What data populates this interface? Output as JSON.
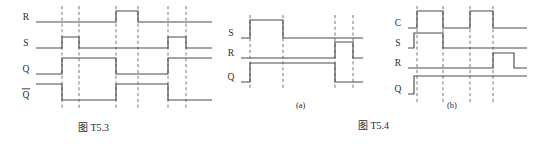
{
  "page": {
    "background": "#ffffff",
    "ink": "#4a4a4a",
    "text_color": "#2b2b2b",
    "width": 540,
    "height": 144
  },
  "figures": [
    {
      "id": "fig-t53",
      "caption": "图 T5.3",
      "sub_caption": "",
      "type": "digital-timing-diagram",
      "description": "SR latch timing diagram with R, S, Q and Q-bar waveforms",
      "grid_lines_x": [
        62,
        79,
        116,
        138,
        168,
        186
      ],
      "signals": [
        {
          "name": "R",
          "label": "R",
          "overbar": false,
          "baseline_y": 22,
          "high_y": 11,
          "segments": [
            {
              "x_start": 36,
              "x_end": 116,
              "level": "low"
            },
            {
              "x_start": 116,
              "x_end": 138,
              "level": "high"
            },
            {
              "x_start": 138,
              "x_end": 212,
              "level": "low"
            }
          ]
        },
        {
          "name": "S",
          "label": "S",
          "overbar": false,
          "baseline_y": 48,
          "high_y": 37,
          "segments": [
            {
              "x_start": 36,
              "x_end": 62,
              "level": "low"
            },
            {
              "x_start": 62,
              "x_end": 79,
              "level": "high"
            },
            {
              "x_start": 79,
              "x_end": 168,
              "level": "low"
            },
            {
              "x_start": 168,
              "x_end": 186,
              "level": "high"
            },
            {
              "x_start": 186,
              "x_end": 212,
              "level": "low"
            }
          ]
        },
        {
          "name": "Q",
          "label": "Q",
          "overbar": false,
          "baseline_y": 74,
          "high_y": 58,
          "segments": [
            {
              "x_start": 36,
              "x_end": 62,
              "level": "low"
            },
            {
              "x_start": 62,
              "x_end": 116,
              "level": "high"
            },
            {
              "x_start": 116,
              "x_end": 168,
              "level": "low"
            },
            {
              "x_start": 168,
              "x_end": 212,
              "level": "high"
            }
          ]
        },
        {
          "name": "Qbar",
          "label": "Q",
          "overbar": true,
          "baseline_y": 100,
          "high_y": 84,
          "segments": [
            {
              "x_start": 36,
              "x_end": 62,
              "level": "high"
            },
            {
              "x_start": 62,
              "x_end": 116,
              "level": "low"
            },
            {
              "x_start": 116,
              "x_end": 168,
              "level": "high"
            },
            {
              "x_start": 168,
              "x_end": 212,
              "level": "low"
            }
          ]
        }
      ]
    },
    {
      "id": "fig-t54a",
      "caption": "",
      "sub_caption": "(a)",
      "type": "digital-timing-diagram",
      "description": "Timing diagram (a) with S, R and Q waveforms",
      "grid_lines_x": [
        250,
        283,
        335,
        353
      ],
      "signals": [
        {
          "name": "S",
          "label": "S",
          "overbar": false,
          "baseline_y": 38,
          "high_y": 20,
          "segments": [
            {
              "x_start": 241,
              "x_end": 250,
              "level": "low"
            },
            {
              "x_start": 250,
              "x_end": 283,
              "level": "high"
            },
            {
              "x_start": 283,
              "x_end": 363,
              "level": "low"
            }
          ]
        },
        {
          "name": "R",
          "label": "R",
          "overbar": false,
          "baseline_y": 58,
          "high_y": 42,
          "segments": [
            {
              "x_start": 241,
              "x_end": 335,
              "level": "low"
            },
            {
              "x_start": 335,
              "x_end": 353,
              "level": "high"
            },
            {
              "x_start": 353,
              "x_end": 363,
              "level": "low"
            }
          ]
        },
        {
          "name": "Q",
          "label": "Q",
          "overbar": false,
          "baseline_y": 82,
          "high_y": 63,
          "segments": [
            {
              "x_start": 241,
              "x_end": 250,
              "level": "low"
            },
            {
              "x_start": 250,
              "x_end": 335,
              "level": "high"
            },
            {
              "x_start": 335,
              "x_end": 363,
              "level": "low"
            }
          ]
        }
      ]
    },
    {
      "id": "fig-t54b",
      "caption": "图 T5.4",
      "sub_caption": "(b)",
      "type": "digital-timing-diagram",
      "description": "Clocked SR flip-flop timing diagram (b) with C, S, R and Q waveforms",
      "grid_lines_x": [
        417,
        443,
        470,
        493
      ],
      "signals": [
        {
          "name": "C",
          "label": "C",
          "overbar": false,
          "baseline_y": 28,
          "high_y": 11,
          "segments": [
            {
              "x_start": 408,
              "x_end": 417,
              "level": "low"
            },
            {
              "x_start": 417,
              "x_end": 443,
              "level": "high"
            },
            {
              "x_start": 443,
              "x_end": 470,
              "level": "low"
            },
            {
              "x_start": 470,
              "x_end": 493,
              "level": "high"
            },
            {
              "x_start": 493,
              "x_end": 527,
              "level": "low"
            }
          ]
        },
        {
          "name": "S",
          "label": "S",
          "overbar": false,
          "baseline_y": 48,
          "high_y": 33,
          "segments": [
            {
              "x_start": 408,
              "x_end": 414,
              "level": "low"
            },
            {
              "x_start": 414,
              "x_end": 443,
              "level": "high"
            },
            {
              "x_start": 443,
              "x_end": 527,
              "level": "low"
            }
          ]
        },
        {
          "name": "R",
          "label": "R",
          "overbar": false,
          "baseline_y": 68,
          "high_y": 53,
          "segments": [
            {
              "x_start": 408,
              "x_end": 493,
              "level": "low"
            },
            {
              "x_start": 493,
              "x_end": 514,
              "level": "high"
            },
            {
              "x_start": 514,
              "x_end": 527,
              "level": "low"
            }
          ]
        },
        {
          "name": "Q",
          "label": "Q",
          "overbar": false,
          "baseline_y": 94,
          "high_y": 76,
          "segments": [
            {
              "x_start": 408,
              "x_end": 414,
              "level": "low"
            },
            {
              "x_start": 414,
              "x_end": 527,
              "level": "high"
            }
          ]
        }
      ]
    }
  ],
  "captions": {
    "t53": "图 T5.3",
    "t54": "图 T5.4",
    "sub_a": "(a)",
    "sub_b": "(b)"
  },
  "chart_data": {
    "type": "line",
    "xlabel": "",
    "ylabel": "",
    "charts": [
      {
        "name": "图 T5.3",
        "signals": [
          "R",
          "S",
          "Q",
          "Q̄"
        ],
        "grid_count": 6,
        "series": [
          {
            "name": "R",
            "values": [
              0,
              0,
              0,
              1,
              0,
              0,
              0
            ]
          },
          {
            "name": "S",
            "values": [
              0,
              1,
              0,
              0,
              0,
              1,
              0
            ]
          },
          {
            "name": "Q",
            "values": [
              0,
              1,
              1,
              0,
              0,
              1,
              1
            ]
          },
          {
            "name": "Q̄",
            "values": [
              1,
              0,
              0,
              1,
              1,
              0,
              0
            ]
          }
        ]
      },
      {
        "name": "(a)",
        "signals": [
          "S",
          "R",
          "Q"
        ],
        "grid_count": 4,
        "series": [
          {
            "name": "S",
            "values": [
              0,
              1,
              0,
              0,
              0
            ]
          },
          {
            "name": "R",
            "values": [
              0,
              0,
              0,
              1,
              0
            ]
          },
          {
            "name": "Q",
            "values": [
              0,
              1,
              1,
              0,
              0
            ]
          }
        ]
      },
      {
        "name": "(b)",
        "signals": [
          "C",
          "S",
          "R",
          "Q"
        ],
        "grid_count": 4,
        "series": [
          {
            "name": "C",
            "values": [
              0,
              1,
              0,
              1,
              0
            ]
          },
          {
            "name": "S",
            "values": [
              1,
              1,
              0,
              0,
              0
            ]
          },
          {
            "name": "R",
            "values": [
              0,
              0,
              0,
              0,
              1
            ]
          },
          {
            "name": "Q",
            "values": [
              0,
              1,
              1,
              1,
              1
            ]
          }
        ]
      }
    ]
  }
}
